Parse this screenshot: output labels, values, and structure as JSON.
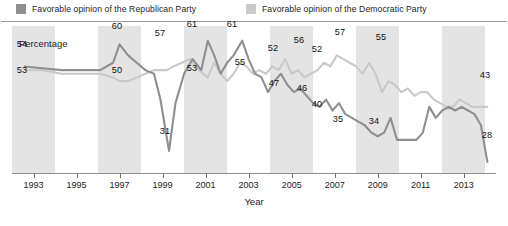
{
  "legend": {
    "entries": [
      {
        "label": "Favorable opinion of the Republican Party",
        "color": "#8f8f8f",
        "key": "republican"
      },
      {
        "label": "Favorable opinion of the Democratic Party",
        "color": "#c9c9c9",
        "key": "democratic"
      }
    ]
  },
  "axis": {
    "y_title": "Percentage",
    "x_title": "Year"
  },
  "chart_data": {
    "type": "line",
    "title": "",
    "subtitle": "",
    "xlabel": "Year",
    "ylabel": "Percentage",
    "xlim": [
      1992,
      2014.5
    ],
    "ylim": [
      25,
      65
    ],
    "grid": false,
    "legend_position": "top",
    "background_bands": "alternating vertical gray/white bands, one per two-year interval",
    "x_tick_labels": [
      "1993",
      "1995",
      "1997",
      "1999",
      "2001",
      "2003",
      "2005",
      "2007",
      "2009",
      "2011",
      "2013"
    ],
    "x_ticks": [
      1993,
      1995,
      1997,
      1999,
      2001,
      2003,
      2005,
      2007,
      2009,
      2011,
      2013
    ],
    "series": [
      {
        "name": "Favorable opinion of the Republican Party",
        "color": "#8f8f8f",
        "x": [
          1992.6,
          1993.4,
          1994.3,
          1995.2,
          1996.1,
          1996.7,
          1997.0,
          1997.4,
          1997.8,
          1998.2,
          1998.6,
          1998.9,
          1999.1,
          1999.3,
          1999.6,
          2000.0,
          2000.4,
          2000.8,
          2001.1,
          2001.4,
          2001.7,
          2002.0,
          2002.3,
          2002.7,
          2003.0,
          2003.3,
          2003.6,
          2003.9,
          2004.2,
          2004.5,
          2004.8,
          2005.1,
          2005.4,
          2005.7,
          2006.0,
          2006.3,
          2006.6,
          2006.9,
          2007.2,
          2007.5,
          2007.8,
          2008.1,
          2008.4,
          2008.7,
          2009.0,
          2009.3,
          2009.6,
          2009.9,
          2010.2,
          2010.5,
          2010.8,
          2011.1,
          2011.4,
          2011.7,
          2012.0,
          2012.3,
          2012.6,
          2012.9,
          2013.2,
          2013.5,
          2013.8,
          2014.1
        ],
        "y": [
          54,
          53.5,
          53,
          53,
          53,
          55,
          60,
          57,
          55,
          53,
          52,
          45,
          38,
          31,
          44,
          52,
          56,
          53,
          61,
          57,
          52,
          55,
          57,
          61,
          56,
          52,
          51,
          47,
          50,
          52,
          49,
          47,
          48,
          46,
          44,
          43,
          45,
          42,
          44,
          41,
          40,
          39,
          38,
          36,
          35,
          36,
          40,
          34,
          34,
          34,
          34,
          36,
          43,
          40,
          42,
          43,
          42,
          43,
          42,
          41,
          38,
          28
        ],
        "labelled_points": [
          {
            "year": 1992.6,
            "value": 54
          },
          {
            "year": 1997.0,
            "value": 60
          },
          {
            "year": 1997.4,
            "value": 57
          },
          {
            "year": 1999.3,
            "value": 31
          },
          {
            "year": 2001.1,
            "value": 61
          },
          {
            "year": 2002.7,
            "value": 61
          },
          {
            "year": 2003.9,
            "value": 47
          },
          {
            "year": 2005.7,
            "value": 46
          },
          {
            "year": 2007.8,
            "value": 40
          },
          {
            "year": 2009.0,
            "value": 35
          },
          {
            "year": 2009.9,
            "value": 34
          },
          {
            "year": 2014.1,
            "value": 28
          }
        ]
      },
      {
        "name": "Favorable opinion of the Democratic Party",
        "color": "#c9c9c9",
        "x": [
          1992.6,
          1993.4,
          1994.3,
          1995.2,
          1996.1,
          1996.7,
          1997.0,
          1997.4,
          1997.8,
          1998.2,
          1998.6,
          1998.9,
          1999.2,
          1999.5,
          1999.9,
          2000.3,
          2000.7,
          2001.1,
          2001.4,
          2001.7,
          2002.0,
          2002.3,
          2002.6,
          2002.9,
          2003.2,
          2003.5,
          2003.8,
          2004.1,
          2004.4,
          2004.7,
          2005.0,
          2005.3,
          2005.6,
          2005.9,
          2006.2,
          2006.5,
          2006.8,
          2007.1,
          2007.4,
          2007.7,
          2008.0,
          2008.3,
          2008.6,
          2008.9,
          2009.2,
          2009.5,
          2009.8,
          2010.1,
          2010.4,
          2010.7,
          2011.0,
          2011.3,
          2011.6,
          2011.9,
          2012.2,
          2012.5,
          2012.8,
          2013.1,
          2013.4,
          2013.7,
          2014.1
        ],
        "y": [
          53,
          53,
          52,
          52,
          52,
          51,
          50,
          50,
          51,
          52,
          53,
          53,
          53,
          54,
          55,
          56,
          53,
          51,
          55,
          52,
          50,
          52,
          55,
          54,
          52,
          53,
          52,
          54,
          53,
          56,
          52,
          53,
          51,
          52,
          53,
          55,
          54,
          57,
          56,
          55,
          54,
          52,
          55,
          52,
          47,
          50,
          49,
          47,
          48,
          46,
          47,
          47,
          45,
          44,
          43,
          43,
          45,
          44,
          43,
          43,
          43
        ],
        "labelled_points": [
          {
            "year": 1992.6,
            "value": 53
          },
          {
            "year": 1997.0,
            "value": 50
          },
          {
            "year": 1999.2,
            "value": 53
          },
          {
            "year": 2001.4,
            "value": 55
          },
          {
            "year": 2003.2,
            "value": 52
          },
          {
            "year": 2004.7,
            "value": 56
          },
          {
            "year": 2005.3,
            "value": 52
          },
          {
            "year": 2007.1,
            "value": 57
          },
          {
            "year": 2008.6,
            "value": 55
          },
          {
            "year": 2014.1,
            "value": 43
          }
        ]
      }
    ],
    "annotations": [
      {
        "text": "54",
        "series": "republican"
      },
      {
        "text": "53",
        "series": "democratic"
      },
      {
        "text": "60",
        "series": "republican"
      },
      {
        "text": "50",
        "series": "democratic"
      },
      {
        "text": "57",
        "series": "republican"
      },
      {
        "text": "31",
        "series": "republican"
      },
      {
        "text": "53",
        "series": "democratic"
      },
      {
        "text": "61",
        "series": "republican"
      },
      {
        "text": "55",
        "series": "democratic"
      },
      {
        "text": "61",
        "series": "republican"
      },
      {
        "text": "52",
        "series": "democratic"
      },
      {
        "text": "47",
        "series": "republican"
      },
      {
        "text": "56",
        "series": "democratic"
      },
      {
        "text": "52",
        "series": "democratic"
      },
      {
        "text": "46",
        "series": "republican"
      },
      {
        "text": "57",
        "series": "democratic"
      },
      {
        "text": "40",
        "series": "republican"
      },
      {
        "text": "35",
        "series": "republican"
      },
      {
        "text": "55",
        "series": "democratic"
      },
      {
        "text": "34",
        "series": "republican"
      },
      {
        "text": "43",
        "series": "democratic"
      },
      {
        "text": "28",
        "series": "republican"
      }
    ]
  },
  "point_labels": [
    {
      "text": "54",
      "x": 22,
      "y": 44
    },
    {
      "text": "53",
      "x": 22,
      "y": 70
    },
    {
      "text": "60",
      "x": 117,
      "y": 26
    },
    {
      "text": "50",
      "x": 117,
      "y": 70
    },
    {
      "text": "57",
      "x": 160,
      "y": 33
    },
    {
      "text": "31",
      "x": 165,
      "y": 131
    },
    {
      "text": "53",
      "x": 192,
      "y": 68
    },
    {
      "text": "61",
      "x": 192,
      "y": 24
    },
    {
      "text": "55",
      "x": 240,
      "y": 62
    },
    {
      "text": "61",
      "x": 232,
      "y": 24
    },
    {
      "text": "52",
      "x": 273,
      "y": 48
    },
    {
      "text": "47",
      "x": 274,
      "y": 83
    },
    {
      "text": "56",
      "x": 299,
      "y": 40
    },
    {
      "text": "46",
      "x": 302,
      "y": 88
    },
    {
      "text": "52",
      "x": 317,
      "y": 49
    },
    {
      "text": "57",
      "x": 340,
      "y": 32
    },
    {
      "text": "40",
      "x": 317,
      "y": 104
    },
    {
      "text": "35",
      "x": 338,
      "y": 119
    },
    {
      "text": "55",
      "x": 381,
      "y": 37
    },
    {
      "text": "34",
      "x": 374,
      "y": 121
    },
    {
      "text": "43",
      "x": 485,
      "y": 75
    },
    {
      "text": "28",
      "x": 487,
      "y": 135
    }
  ]
}
